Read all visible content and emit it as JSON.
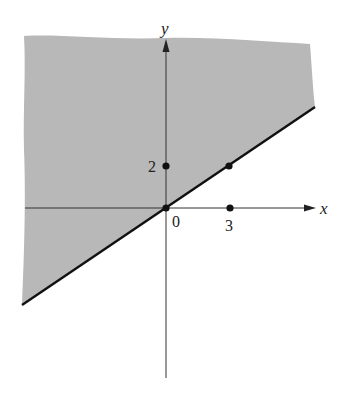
{
  "figure": {
    "axes": {
      "x_label": "x",
      "y_label": "y"
    },
    "tick_labels": {
      "origin": "0",
      "x_tick": "3",
      "y_tick": "2"
    },
    "boundary_line": {
      "equation": "y = (2/3)x",
      "style": "solid"
    },
    "points": [
      {
        "name": "origin",
        "x": 0,
        "y": 0
      },
      {
        "name": "y-intercept-marker",
        "x": 0,
        "y": 2
      },
      {
        "name": "x-marker",
        "x": 3,
        "y": 0
      },
      {
        "name": "line-point",
        "x": 3,
        "y": 2
      }
    ],
    "colors": {
      "shade": "#b8b8b8",
      "line": "#111111",
      "axis": "#333333"
    }
  }
}
